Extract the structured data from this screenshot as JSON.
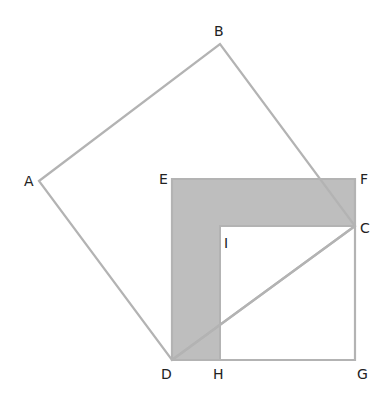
{
  "diagram": {
    "title": "",
    "colors": {
      "line": "#b3b3b3",
      "fill": "#bebebe",
      "label": "#222222",
      "background": "#ffffff"
    },
    "points": {
      "A": {
        "label": "A",
        "x": 39,
        "y": 181
      },
      "B": {
        "label": "B",
        "x": 220,
        "y": 44
      },
      "C": {
        "label": "C",
        "x": 355,
        "y": 226
      },
      "D": {
        "label": "D",
        "x": 172,
        "y": 360
      },
      "E": {
        "label": "E",
        "x": 172,
        "y": 179
      },
      "F": {
        "label": "F",
        "x": 355,
        "y": 179
      },
      "G": {
        "label": "G",
        "x": 355,
        "y": 360
      },
      "H": {
        "label": "H",
        "x": 220,
        "y": 360
      },
      "I": {
        "label": "I",
        "x": 220,
        "y": 226
      }
    },
    "shapes": [
      {
        "name": "square-ABCD",
        "type": "polygon",
        "vertices": [
          "A",
          "B",
          "C",
          "D"
        ],
        "filled": false
      },
      {
        "name": "square-EFGD",
        "type": "polygon",
        "vertices": [
          "E",
          "F",
          "G",
          "D"
        ],
        "filled": false
      },
      {
        "name": "shaded-gnomon-EFCIHD",
        "type": "polygon",
        "vertices": [
          "E",
          "F",
          "C",
          "I",
          "H",
          "D"
        ],
        "filled": true
      },
      {
        "name": "segment-DC",
        "type": "segment",
        "vertices": [
          "D",
          "C"
        ]
      }
    ]
  }
}
